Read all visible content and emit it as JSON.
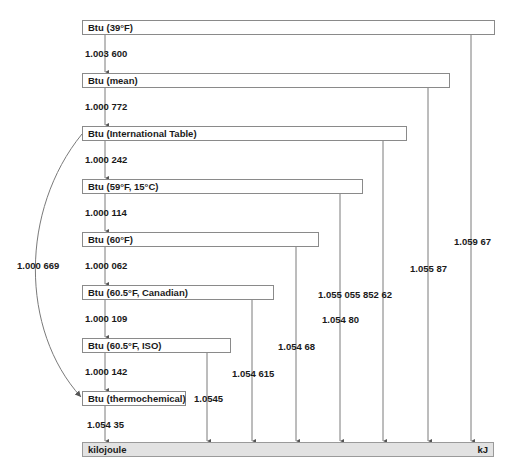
{
  "diagram": {
    "units": [
      {
        "label": "Btu (39°F)",
        "to_kj": "1.059 67"
      },
      {
        "label": "Btu (mean)",
        "to_kj": "1.055 87"
      },
      {
        "label": "Btu (International Table)",
        "to_kj": "1.055 055 852 62"
      },
      {
        "label": "Btu (59°F, 15°C)",
        "to_kj": "1.054 80"
      },
      {
        "label": "Btu (60°F)",
        "to_kj": "1.054 68"
      },
      {
        "label": "Btu (60.5°F, Canadian)",
        "to_kj": "1.054 615"
      },
      {
        "label": "Btu (60.5°F, ISO)",
        "to_kj": "1.0545"
      },
      {
        "label": "Btu (thermochemical)",
        "to_kj": "1.054 35"
      }
    ],
    "chain_factors": [
      "1.003 600",
      "1.000 772",
      "1.000 242",
      "1.000 114",
      "1.000 062",
      "1.000 109",
      "1.000 142"
    ],
    "curve_factor": "1.000 669",
    "target": {
      "label": "kilojoule",
      "unit": "kJ"
    },
    "colors": {
      "line": "#7a7a7a",
      "box_border": "#8a8a8a",
      "target_fill": "#e2e2e2"
    }
  }
}
